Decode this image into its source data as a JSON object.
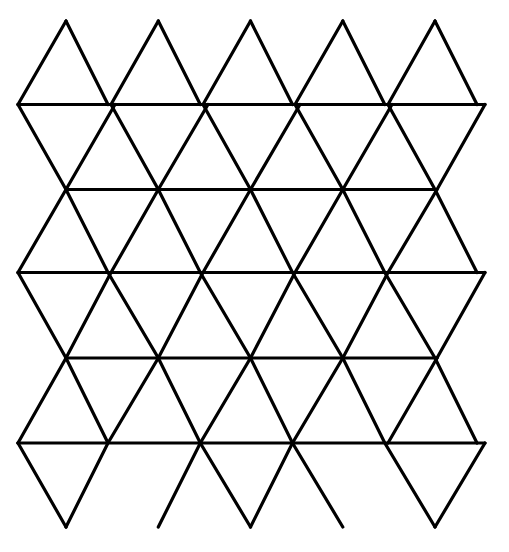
{
  "figure": {
    "name": "triangular-lattice-diagram",
    "type": "line-drawing",
    "background_color": "#ffffff",
    "stroke_color": "#000000",
    "stroke_width": 3.2,
    "stroke_linecap": "round",
    "stroke_linejoin": "miter",
    "canvas": {
      "width": 509,
      "height": 552
    }
  },
  "geometry": {
    "description": "Regular triangular (isometric) grid of equilateral triangles arranged in 6 bands.",
    "column_spacing": 92.3,
    "half_column_spacing": 46.15,
    "row_height": 84.4,
    "apex_columns": 5,
    "row_levels_y": [
      21,
      104.5,
      189.5,
      272.5,
      358,
      443,
      527
    ],
    "row_offsets_x": [
      66,
      18,
      68,
      18,
      68,
      18,
      68
    ],
    "horizontal_rows": [
      {
        "index": 0,
        "y": 104.5,
        "x_start": 18,
        "x_end": 485,
        "label": "row-1-horizontal"
      },
      {
        "index": 1,
        "y": 189.5,
        "x_start": 66,
        "x_end": 437,
        "label": "row-2-horizontal"
      },
      {
        "index": 2,
        "y": 272.5,
        "x_start": 18,
        "x_end": 485,
        "label": "row-3-horizontal"
      },
      {
        "index": 3,
        "y": 358.0,
        "x_start": 66,
        "x_end": 437,
        "label": "row-4-horizontal"
      },
      {
        "index": 4,
        "y": 443.0,
        "x_start": 18,
        "x_end": 485,
        "label": "row-5-horizontal"
      }
    ],
    "top_apexes_x": [
      66,
      158.3,
      250.5,
      342.8,
      435
    ],
    "bottom_apexes_x": [
      66,
      158.3,
      250.5,
      342.8,
      435
    ],
    "left_vertices_x": 18,
    "right_vertices_x": 485
  },
  "paths": {
    "down_right_diagonals": [
      "M 66,21 L 108,104.5",
      "M 158.3,21 L 200.3,104.5",
      "M 250.5,21 L 292.5,104.5",
      "M 342.8,21 L 384.8,104.5",
      "M 435,21 L 477,104.5",
      "M 18,104.5 L 66,189.5 L 108,272.5 L 158.3,358 L 200.3,443 L 250.5,527",
      "M 111,104.5 L 158.3,189.5 L 200.3,272.5 L 250.5,358 L 292.5,443 L 342.8,527",
      "M 203,104.5 L 250.5,189.5 L 292.5,272.5 L 342.8,358 L 384.8,443 L 435,527",
      "M 295,104.5 L 342.8,189.5 L 384.8,272.5 L 435,358 L 477,443",
      "M 388,104.5 L 435,189.5 L 477,272.5",
      "M 66,358 L 108,443",
      "M 18,272.5 L 66,358",
      "M 18,443 L 66,527"
    ],
    "down_left_diagonals": [
      "M 66,21 L 18,104.5",
      "M 158.3,21 L 111,104.5",
      "M 250.5,21 L 203,104.5",
      "M 342.8,21 L 295,104.5",
      "M 435,21 L 388,104.5",
      "M 485,104.5 L 437,189.5 L 388,272.5 L 342.8,358 L 292.5,443 L 250.5,527",
      "M 392,104.5 L 342.8,189.5 L 295,272.5 L 250.5,358 L 200.3,443 L 158.3,527",
      "M 300,104.5 L 250.5,189.5 L 203,272.5 L 158.3,358 L 108,443 L 66,527",
      "M 208,104.5 L 158.3,189.5 L 111,272.5 L 66,358 L 18,443",
      "M 115,104.5 L 66,189.5 L 18,272.5",
      "M 437,358 L 388,443",
      "M 485,272.5 L 437,358",
      "M 485,443 L 435,527"
    ]
  },
  "chart_data": {
    "type": "line",
    "xlabel": "",
    "ylabel": "",
    "categories": [],
    "values": [],
    "grid": true,
    "legend_position": "none"
  }
}
